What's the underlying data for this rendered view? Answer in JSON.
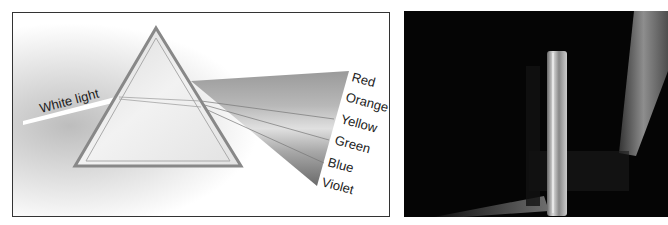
{
  "figure": {
    "left_panel": {
      "title": "Prism dispersion diagram",
      "incoming_label": "White light",
      "spectrum_labels": [
        "Red",
        "Orange",
        "Yellow",
        "Green",
        "Blue",
        "Violet"
      ]
    },
    "right_panel": {
      "title": "Photograph of glass prism dispersing light"
    }
  }
}
